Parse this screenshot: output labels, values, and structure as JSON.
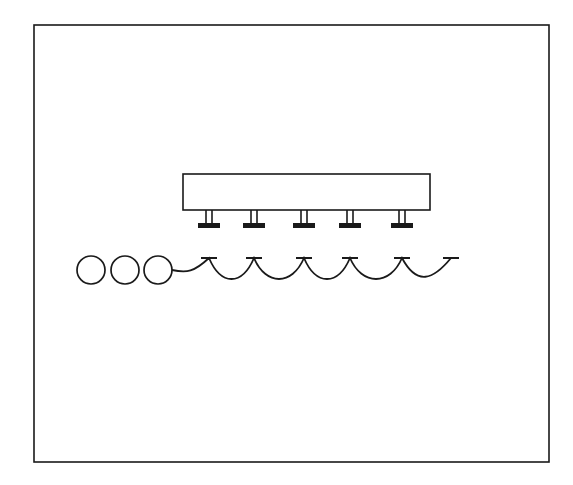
{
  "diagram": {
    "type": "schematic",
    "stroke_color": "#1a1a1a",
    "background": "#ffffff",
    "frame": {
      "x": 34,
      "y": 25,
      "w": 515,
      "h": 437
    },
    "head": {
      "x": 183,
      "y": 174,
      "w": 247,
      "h": 36
    },
    "nozzles": [
      {
        "x": 209
      },
      {
        "x": 254
      },
      {
        "x": 304
      },
      {
        "x": 350
      },
      {
        "x": 402
      }
    ],
    "rollers": [
      {
        "cx": 91,
        "cy": 270,
        "r": 14
      },
      {
        "cx": 125,
        "cy": 270,
        "r": 14
      },
      {
        "cx": 158,
        "cy": 270,
        "r": 14
      }
    ],
    "web": {
      "start_x": 172,
      "end_x": 463,
      "baseline_y": 258,
      "sag_y": 272
    }
  }
}
